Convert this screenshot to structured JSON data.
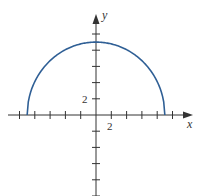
{
  "chart_data": {
    "type": "line",
    "title": "",
    "function": "y = sqrt(81 - x^2)",
    "xlabel": "x",
    "ylabel": "y",
    "xlim": [
      -11,
      12
    ],
    "ylim": [
      -10,
      12
    ],
    "tick_spacing": 2,
    "x_tick_label": "2",
    "y_tick_label": "2",
    "grid": false,
    "series": [
      {
        "name": "semicircle",
        "color": "#2f5f95",
        "x": [
          -9,
          -8,
          -6,
          -4,
          -2,
          0,
          2,
          4,
          6,
          8,
          9
        ],
        "y": [
          0,
          4.12,
          6.71,
          8.06,
          8.77,
          9,
          8.77,
          8.06,
          6.71,
          4.12,
          0
        ]
      }
    ]
  },
  "labels": {
    "x_axis": "x",
    "y_axis": "y",
    "x_tick": "2",
    "y_tick": "2"
  },
  "colors": {
    "curve": "#2f5f95",
    "axis": "#333333"
  }
}
